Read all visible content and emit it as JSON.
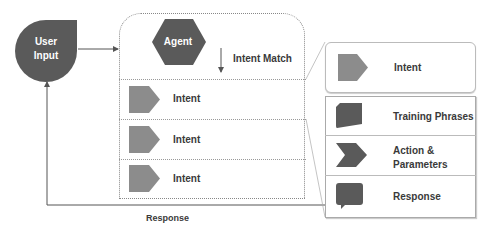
{
  "diagram": {
    "user_input": {
      "label_line1": "User",
      "label_line2": "Input"
    },
    "agent": {
      "label": "Agent"
    },
    "intent_match_label": "Intent Match",
    "agent_intents": [
      {
        "label": "Intent"
      },
      {
        "label": "Intent"
      },
      {
        "label": "Intent"
      }
    ],
    "detail_panel": {
      "header": {
        "label": "Intent"
      },
      "items": [
        {
          "label": "Training Phrases",
          "icon": "document-icon"
        },
        {
          "label_line1": "Action &",
          "label_line2": "Parameters",
          "icon": "chevron-icon"
        },
        {
          "label": "Response",
          "icon": "speech-bubble-icon"
        }
      ]
    },
    "feedback_label": "Response",
    "colors": {
      "dark_shape": "#5a5a5a",
      "intent_shape": "#8c8c8c",
      "line": "#555555",
      "dotted_border": "#888888"
    }
  }
}
